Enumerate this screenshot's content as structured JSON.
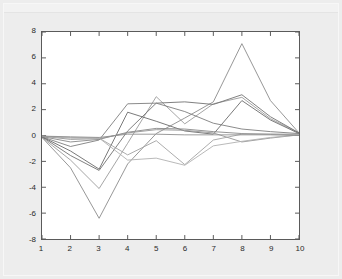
{
  "figure": {
    "background_color": "#ededed",
    "plot_background_color": "#ffffff",
    "axis_color": "#5a5a5a",
    "title": "",
    "x_axis_label": ""
  },
  "chart_data": {
    "type": "line",
    "title": "",
    "subtitle": "",
    "xlabel": "",
    "ylabel": "",
    "xlim": [
      1,
      10
    ],
    "ylim": [
      -8,
      8
    ],
    "grid": false,
    "legend": false,
    "legend_position": "none",
    "x": [
      1,
      2,
      3,
      4,
      5,
      6,
      7,
      8,
      9,
      10
    ],
    "xticks": [
      1,
      2,
      3,
      4,
      5,
      6,
      7,
      8,
      9,
      10
    ],
    "xtick_labels": [
      "1",
      "2",
      "3",
      "4",
      "5",
      "6",
      "7",
      "8",
      "9",
      "10"
    ],
    "yticks": [
      -8,
      -6,
      -4,
      -2,
      0,
      2,
      4,
      6,
      8
    ],
    "ytick_labels": [
      "-8",
      "-6",
      "-4",
      "-2",
      "0",
      "2",
      "4",
      "6",
      "8"
    ],
    "annotations": [],
    "series": [
      {
        "name": "series-1",
        "color": "#8a8a8a",
        "values": [
          -0.15,
          -2.5,
          -6.4,
          -2.2,
          0.15,
          1.35,
          2.6,
          7.1,
          2.7,
          0.2
        ]
      },
      {
        "name": "series-2",
        "color": "#9a9a9a",
        "values": [
          -0.15,
          -1.9,
          -4.1,
          -0.6,
          3.0,
          0.9,
          2.45,
          2.95,
          1.3,
          0.2
        ]
      },
      {
        "name": "series-3",
        "color": "#707070",
        "values": [
          -0.1,
          -1.55,
          -2.7,
          0.35,
          2.5,
          2.6,
          2.4,
          3.15,
          1.45,
          0.2
        ]
      },
      {
        "name": "series-4",
        "color": "#6a6a6a",
        "values": [
          -0.1,
          -1.2,
          -2.6,
          1.8,
          1.1,
          0.35,
          0.1,
          2.7,
          1.2,
          0.15
        ]
      },
      {
        "name": "series-5",
        "color": "#7d7d7d",
        "values": [
          -0.1,
          -0.85,
          -0.35,
          2.45,
          2.5,
          1.85,
          0.95,
          0.5,
          0.3,
          0.15
        ]
      },
      {
        "name": "series-6",
        "color": "#878787",
        "values": [
          -0.08,
          -0.5,
          -0.3,
          0.25,
          0.55,
          0.5,
          0.3,
          0.15,
          0.1,
          0.1
        ]
      },
      {
        "name": "series-7",
        "color": "#949494",
        "values": [
          -0.05,
          -0.3,
          -0.25,
          0.2,
          0.45,
          0.4,
          0.2,
          -0.5,
          -0.2,
          0.05
        ]
      },
      {
        "name": "series-8",
        "color": "#a2a2a2",
        "values": [
          -0.05,
          -0.2,
          -0.2,
          -1.5,
          -0.4,
          -2.25,
          -0.35,
          0.1,
          0.1,
          0.05
        ]
      },
      {
        "name": "series-9",
        "color": "#b0b0b0",
        "values": [
          -0.05,
          -0.15,
          -0.2,
          -1.9,
          -1.75,
          -2.3,
          -0.8,
          -0.45,
          -0.15,
          0.05
        ]
      },
      {
        "name": "series-10",
        "color": "#8f8f8f",
        "values": [
          -0.05,
          -0.1,
          -0.15,
          0.1,
          0.1,
          0.05,
          0.05,
          0.05,
          0.05,
          0.0
        ]
      }
    ]
  }
}
